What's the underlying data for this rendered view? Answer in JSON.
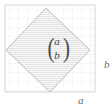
{
  "figure": {
    "type": "geometry-diagram",
    "colors": {
      "background": "#ffffff",
      "grid_line": "#e2e2e2",
      "frame_border": "#cfcfcf",
      "shape_outline": "#b8b8b8",
      "shape_hatch": "#d5d5d5",
      "shape_fill": "#f7f7f7",
      "label_text": "#6b6b6b",
      "vector_text": "#4a4a4a"
    },
    "frame": {
      "x": 5,
      "y": 5,
      "width": 90,
      "height": 87,
      "grid_spacing": 9
    },
    "shape": {
      "name": "rotated-square",
      "vertices": [
        {
          "x": 46,
          "y": 8
        },
        {
          "x": 90,
          "y": 50
        },
        {
          "x": 50,
          "y": 92
        },
        {
          "x": 6,
          "y": 50
        }
      ],
      "hatching": "horizontal",
      "hatch_spacing": 2
    },
    "vector": {
      "name": "column-vector",
      "open_paren": "(",
      "close_paren": ")",
      "top_component": "a",
      "bottom_component": "b",
      "position": {
        "x": 57,
        "y": 49
      }
    },
    "labels": [
      {
        "name": "axis-label-b",
        "text": "b",
        "position": {
          "x": 104,
          "y": 68
        },
        "placement": "right-outside"
      },
      {
        "name": "axis-label-a",
        "text": "a",
        "position": {
          "x": 80,
          "y": 103
        },
        "placement": "bottom-outside"
      }
    ]
  }
}
